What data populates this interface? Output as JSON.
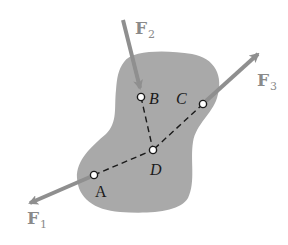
{
  "diagram": {
    "type": "free-body diagram",
    "colors": {
      "body_fill": "#a9a9a9",
      "arrow": "#8f8f8f",
      "force_label": "#8a8a8a",
      "point_label": "#1a1a1a",
      "dash_line": "#1a1a1a",
      "point_fill": "#ffffff",
      "background": "#ffffff"
    },
    "forces": [
      {
        "id": "F1",
        "symbol": "F",
        "subscript": "1",
        "applied_at": "A"
      },
      {
        "id": "F2",
        "symbol": "F",
        "subscript": "2",
        "applied_at": "B"
      },
      {
        "id": "F3",
        "symbol": "F",
        "subscript": "3",
        "applied_at": "C"
      }
    ],
    "points": [
      {
        "id": "A",
        "label": "A"
      },
      {
        "id": "B",
        "label": "B"
      },
      {
        "id": "C",
        "label": "C"
      },
      {
        "id": "D",
        "label": "D"
      }
    ],
    "connections": [
      {
        "from": "A",
        "to": "D",
        "style": "dashed"
      },
      {
        "from": "B",
        "to": "D",
        "style": "dashed"
      },
      {
        "from": "C",
        "to": "D",
        "style": "dashed"
      }
    ]
  }
}
